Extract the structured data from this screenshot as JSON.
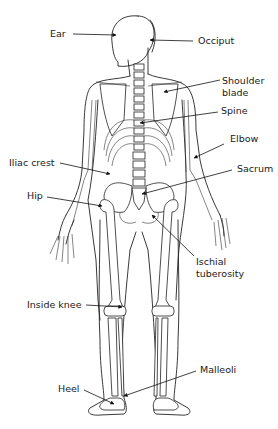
{
  "diagram": {
    "labels": [
      {
        "id": "ear",
        "text": "Ear"
      },
      {
        "id": "occiput",
        "text": "Occiput"
      },
      {
        "id": "shoulder_blade",
        "text": "Shoulder\nblade",
        "line1": "Shoulder",
        "line2": "blade"
      },
      {
        "id": "spine",
        "text": "Spine"
      },
      {
        "id": "elbow",
        "text": "Elbow"
      },
      {
        "id": "iliac_crest",
        "text": "Iliac crest"
      },
      {
        "id": "sacrum",
        "text": "Sacrum"
      },
      {
        "id": "hip",
        "text": "Hip"
      },
      {
        "id": "ischial_tuberosity",
        "text": "Ischial\ntuberosity",
        "line1": "Ischial",
        "line2": "tuberosity"
      },
      {
        "id": "inside_knee",
        "text": "Inside knee"
      },
      {
        "id": "malleoli",
        "text": "Malleoli"
      },
      {
        "id": "heel",
        "text": "Heel"
      }
    ]
  }
}
